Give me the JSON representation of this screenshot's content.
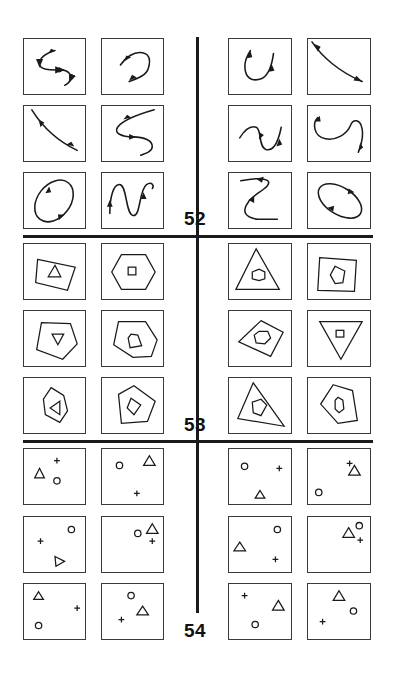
{
  "sections": [
    {
      "id": "52",
      "label": "52",
      "type": "curves-with-arrows",
      "left_pair": [
        "s-curve",
        "hook-curve",
        "diagonal-line",
        "s-curve-reversed",
        "ellipse",
        "wave"
      ],
      "right_pair": [
        "u-curve",
        "diagonal-line",
        "wave",
        "double-hook",
        "z-curve",
        "ellipse"
      ]
    },
    {
      "id": "53",
      "label": "53",
      "type": "nested-polygons",
      "left_pair": [
        "quad-with-triangle",
        "hexagon-with-square",
        "pentagon-with-inverted-triangle",
        "pentagon-with-pentagon",
        "hexagon-with-left-triangle",
        "pentagon-with-diamond"
      ],
      "right_pair": [
        "triangle-with-hexagon",
        "square-with-pentagon",
        "diamond-with-hexagon",
        "inverted-triangle-with-square",
        "triangle-with-pentagon",
        "pentagon-with-hexagon"
      ]
    },
    {
      "id": "54",
      "label": "54",
      "type": "scattered-symbols",
      "symbols": [
        "triangle",
        "circle",
        "plus"
      ]
    }
  ],
  "colors": {
    "ink": "#1a1a1a",
    "background": "#ffffff"
  }
}
